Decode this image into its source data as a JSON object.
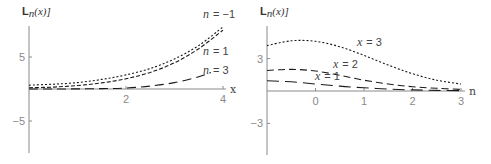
{
  "chart_data": [
    {
      "type": "line",
      "title": "",
      "ylabel": "L_n(x)]",
      "ylabel_parts": {
        "main": "L",
        "sub": "n",
        "rest": "(x)]"
      },
      "xlabel": "x",
      "xlim": [
        0,
        4.1
      ],
      "ylim": [
        -9.5,
        10
      ],
      "xticks": [
        2,
        4
      ],
      "yticks": [
        5,
        -5
      ],
      "grid": false,
      "legend": "inline labels",
      "series": [
        {
          "name": "n = -1",
          "label_n": "n",
          "label_val": "= −1",
          "dash": "2,2",
          "x": [
            0,
            0.5,
            1,
            1.5,
            2,
            2.5,
            3,
            3.5,
            4
          ],
          "y": [
            0.6,
            0.75,
            1.0,
            1.5,
            2.2,
            3.2,
            4.7,
            6.8,
            9.7
          ]
        },
        {
          "name": "n = 1",
          "label_n": "n",
          "label_val": "= 1",
          "dash": "4,2",
          "x": [
            0,
            0.5,
            1,
            1.5,
            2,
            2.5,
            3,
            3.5,
            4
          ],
          "y": [
            0.2,
            0.3,
            0.55,
            0.95,
            1.6,
            2.6,
            4.1,
            6.3,
            9.2
          ]
        },
        {
          "name": "n = 3",
          "label_n": "n",
          "label_val": "= 3",
          "dash": "9,5",
          "x": [
            0,
            0.5,
            1,
            1.5,
            2,
            2.5,
            3,
            3.5,
            3.75
          ],
          "y": [
            0.0,
            0.0,
            0.02,
            0.06,
            0.15,
            0.45,
            1.0,
            1.9,
            2.6
          ]
        }
      ]
    },
    {
      "type": "line",
      "title": "",
      "ylabel": "L_n(x)]",
      "ylabel_parts": {
        "main": "L",
        "sub": "n",
        "rest": "(x)]"
      },
      "xlabel": "n",
      "xlim": [
        -1,
        3.1
      ],
      "ylim": [
        -6.7,
        8
      ],
      "xticks": [
        0,
        1,
        2,
        3
      ],
      "yticks": [
        3,
        -3
      ],
      "grid": false,
      "legend": "inline labels",
      "series": [
        {
          "name": "x = 3",
          "label_n": "x",
          "label_val": "= 3",
          "dash": "2,2",
          "x": [
            -1,
            -0.5,
            0,
            0.5,
            1,
            1.5,
            2,
            2.5,
            3
          ],
          "y": [
            4.2,
            4.65,
            4.6,
            4.1,
            3.3,
            2.4,
            1.6,
            1.0,
            0.65
          ]
        },
        {
          "name": "x = 2",
          "label_n": "x",
          "label_val": "= 2",
          "dash": "7,4",
          "x": [
            -1,
            -0.5,
            0,
            0.5,
            1,
            1.5,
            2,
            2.5,
            3
          ],
          "y": [
            1.9,
            2.0,
            1.85,
            1.45,
            1.0,
            0.65,
            0.4,
            0.25,
            0.15
          ]
        },
        {
          "name": "x = 1",
          "label_n": "x",
          "label_val": "= 1",
          "dash": "12,6",
          "x": [
            -1,
            -0.5,
            0,
            0.5,
            1,
            1.5,
            2,
            2.5,
            3
          ],
          "y": [
            0.95,
            0.85,
            0.65,
            0.45,
            0.3,
            0.18,
            0.1,
            0.06,
            0.03
          ]
        }
      ]
    }
  ],
  "panels": [
    {
      "origin_px": [
        29,
        89
      ],
      "x_scale_px": 48.5,
      "y_scale_px": 6.4,
      "y_axis_range_px": [
        26,
        153
      ],
      "x_axis_end_px": 226,
      "label_positions": [
        [
          203,
          18
        ],
        [
          203,
          55
        ],
        [
          203,
          74
        ]
      ]
    },
    {
      "origin_px": [
        22,
        91
      ],
      "x_scale_px": 48.5,
      "y_scale_px": 10.8,
      "y_axis_range_px": [
        26,
        155
      ],
      "x_axis_end_px": 220,
      "label_positions": [
        [
          112,
          46
        ],
        [
          88,
          68
        ],
        [
          70,
          80
        ]
      ]
    }
  ]
}
